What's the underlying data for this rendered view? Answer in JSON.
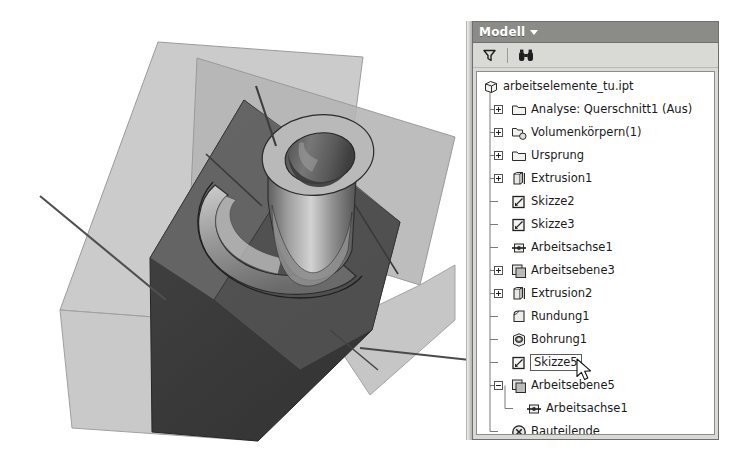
{
  "window": {
    "background_color": "#ffffff",
    "viewport_width": 472,
    "viewport_height": 462
  },
  "browser_panel": {
    "title": "Modell",
    "title_caret": "chevron-down-icon",
    "header_bg": "#8b8b88",
    "panel_bg": "#d9d9d6",
    "tree_bg": "#ffffff",
    "toolbar": [
      {
        "name": "filter-icon",
        "label": "Filter",
        "glyph": "funnel"
      },
      {
        "name": "find-icon",
        "label": "Suchen",
        "glyph": "binoculars"
      }
    ],
    "tree": [
      {
        "label": "arbeitselemente_tu.ipt",
        "icon": "part-box-icon",
        "depth": 0,
        "expander": "none",
        "selected": false
      },
      {
        "label": "Analyse: Querschnitt1 (Aus)",
        "icon": "folder-icon",
        "depth": 1,
        "expander": "plus",
        "selected": false
      },
      {
        "label": "Volumenkörpern(1)",
        "icon": "solid-bodies-folder-icon",
        "depth": 1,
        "expander": "plus",
        "selected": false
      },
      {
        "label": "Ursprung",
        "icon": "folder-icon",
        "depth": 1,
        "expander": "plus",
        "selected": false
      },
      {
        "label": "Extrusion1",
        "icon": "extrude-icon",
        "depth": 1,
        "expander": "plus",
        "selected": false
      },
      {
        "label": "Skizze2",
        "icon": "sketch-icon",
        "depth": 1,
        "expander": "none",
        "selected": false
      },
      {
        "label": "Skizze3",
        "icon": "sketch-icon",
        "depth": 1,
        "expander": "none",
        "selected": false
      },
      {
        "label": "Arbeitsachse1",
        "icon": "work-axis-icon",
        "depth": 1,
        "expander": "none",
        "selected": false
      },
      {
        "label": "Arbeitsebene3",
        "icon": "work-plane-icon",
        "depth": 1,
        "expander": "plus",
        "selected": false
      },
      {
        "label": "Extrusion2",
        "icon": "extrude-icon",
        "depth": 1,
        "expander": "plus",
        "selected": false
      },
      {
        "label": "Rundung1",
        "icon": "fillet-icon",
        "depth": 1,
        "expander": "none",
        "selected": false
      },
      {
        "label": "Bohrung1",
        "icon": "hole-icon",
        "depth": 1,
        "expander": "none",
        "selected": false
      },
      {
        "label": "Skizze5",
        "icon": "sketch-icon",
        "depth": 1,
        "expander": "none",
        "selected": true
      },
      {
        "label": "Arbeitsebene5",
        "icon": "work-plane-icon",
        "depth": 1,
        "expander": "minus",
        "selected": false
      },
      {
        "label": "Arbeitsachse1",
        "icon": "work-axis-icon",
        "depth": 2,
        "expander": "none",
        "selected": false
      },
      {
        "label": "Bauteilende",
        "icon": "end-of-part-icon",
        "depth": 1,
        "expander": "none",
        "selected": false
      }
    ]
  },
  "model_view": {
    "description": "3D CAD part with two intersecting work planes, dark wedge solid and conical boss with bore",
    "colors": {
      "work_plane_light": "#c9c9c9",
      "work_plane_mid": "#b0b0b0",
      "solid_dark": "#3d3d3d",
      "solid_mid": "#6e6e6e",
      "solid_light": "#a8a8a8",
      "edge": "#2a2a2a",
      "axis_line": "#4a4a4a"
    }
  },
  "cursor": {
    "name": "mouse-pointer",
    "x": 100,
    "y": 281
  }
}
